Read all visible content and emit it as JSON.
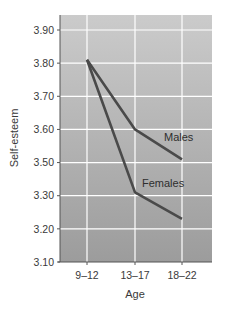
{
  "chart_data": {
    "type": "line",
    "title": "",
    "xlabel": "Age",
    "ylabel": "Self-esteem",
    "categories": [
      "9–12",
      "13–17",
      "18–22"
    ],
    "series": [
      {
        "name": "Males",
        "values": [
          3.81,
          3.6,
          3.51
        ]
      },
      {
        "name": "Females",
        "values": [
          3.81,
          3.32,
          3.23
        ]
      }
    ],
    "y_ticks": [
      "3.90",
      "3.80",
      "3.70",
      "3.60",
      "3.50",
      "3.30",
      "3.20",
      "3.10"
    ],
    "y_tick_note": "Axis is broken: 3.40 omitted; 3.50 is followed directly by 3.30 at equal spacing",
    "ylim": [
      3.1,
      3.95
    ],
    "grid": true,
    "legend": "inline labels next to lines",
    "colors": {
      "plot_bg_top": "#cbcbcb",
      "plot_bg_bottom": "#9c9c9c",
      "grid": "#ffffff",
      "line": "#4a4a4a",
      "axis": "#555555"
    }
  },
  "labels": {
    "males": "Males",
    "females": "Females",
    "xlabel": "Age",
    "ylabel": "Self-esteem"
  }
}
